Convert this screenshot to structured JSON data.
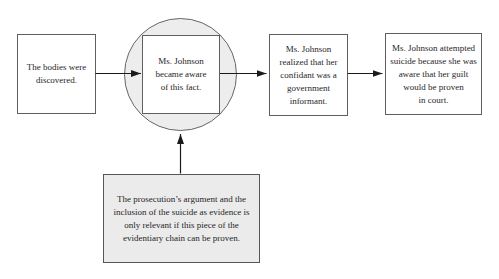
{
  "diagram": {
    "colors": {
      "background": "#ffffff",
      "border": "#5f5f5f",
      "arrow": "#1a1a1a",
      "shade_fill": "#ededed",
      "note_fill": "#ebebeb",
      "text": "#1f1f1f"
    },
    "nodes": {
      "step1": {
        "text": "The bodies were\ndiscovered."
      },
      "step2": {
        "text": "Ms. Johnson\nbecame aware\nof this fact."
      },
      "step3": {
        "text": "Ms. Johnson\nrealized that her\nconfidant was a\ngovernment\ninformant."
      },
      "step4": {
        "text": "Ms. Johnson attempted\nsuicide because she was\naware that her guilt\nwould be proven\nin court."
      },
      "note": {
        "text": "The prosecution’s argument and the\ninclusion of the suicide as evidence is\nonly relevant if this piece of the\nevidentiary chain can be proven."
      }
    },
    "connections": [
      {
        "from": "step1",
        "to": "step2",
        "direction": "right"
      },
      {
        "from": "step2",
        "to": "step3",
        "direction": "right"
      },
      {
        "from": "step3",
        "to": "step4",
        "direction": "right"
      },
      {
        "from": "note",
        "to": "step2",
        "direction": "up"
      }
    ]
  }
}
